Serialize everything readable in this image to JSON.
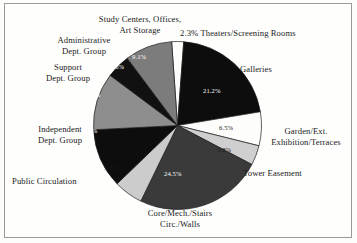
{
  "figure": {
    "background_color": "#fefefd",
    "border_color": "#9a9a9a",
    "text_color": "#1a1a1a"
  },
  "chart_data": {
    "type": "pie",
    "title": "",
    "subtitle": "",
    "xlabel": "",
    "ylabel": "",
    "legend_position": "none",
    "grid": false,
    "units": "percent",
    "start_angle_deg": 356,
    "direction": "clockwise",
    "categories": [
      "Theaters/Screening Rooms",
      "Galleries",
      "Garden/Ext. Exhibition/Terraces",
      "Tower Easement",
      "Core/Mech./Stairs Circ./Walls",
      "Public Circulation",
      "Independent Dept. Group",
      "Support Dept. Group",
      "Administrative Dept. Group",
      "Study Centers, Offices, Art Storage"
    ],
    "values": [
      2.3,
      21.2,
      6.5,
      3.8,
      24.5,
      5.6,
      11.4,
      11.0,
      4.6,
      9.1
    ],
    "value_labels": [
      "2.3%",
      "21.2%",
      "6.5%",
      "3.8%",
      "24.5%",
      "5.6%",
      "11.4%",
      "11.0%",
      "4.6%",
      "9.1%"
    ],
    "colors": [
      "#fdfdfb",
      "#0d0d0d",
      "#fdfdfb",
      "#cfcfcf",
      "#3a3a3a",
      "#cccccc",
      "#0d0d0d",
      "#8e8e8e",
      "#111111",
      "#7c7c7c"
    ],
    "total": 100.0
  },
  "slices": {
    "theaters": {
      "label": "2.3% Theaters/Screening Rooms",
      "pct": "2.3%",
      "name": "Theaters/Screening Rooms"
    },
    "galleries": {
      "label": "Galleries",
      "pct": "21.2%",
      "name": "Galleries"
    },
    "garden": {
      "label_line1": "Garden/Ext.",
      "label_line2": "Exhibition/Terraces",
      "pct": "6.5%",
      "name": "Garden/Ext. Exhibition/Terraces"
    },
    "tower": {
      "label": "Tower Easement",
      "pct": "3.8%",
      "name": "Tower Easement"
    },
    "core": {
      "label_line1": "Core/Mech./Stairs",
      "label_line2": "Circ./Walls",
      "pct": "24.5%",
      "name": "Core/Mech./Stairs Circ./Walls"
    },
    "public": {
      "label": "Public Circulation",
      "pct": "5.6%",
      "name": "Public Circulation"
    },
    "independent": {
      "label_line1": "Independent",
      "label_line2": "Dept. Group",
      "pct": "11.4%",
      "name": "Independent Dept. Group"
    },
    "support": {
      "label_line1": "Support",
      "label_line2": "Dept. Group",
      "pct": "11.0%",
      "name": "Support Dept. Group"
    },
    "administrative": {
      "label_line1": "Administrative",
      "label_line2": "Dept. Group",
      "pct": "4.6%",
      "name": "Administrative Dept. Group"
    },
    "study": {
      "label_line1": "Study Centers, Offices,",
      "label_line2": "Art Storage",
      "pct": "9.1%",
      "name": "Study Centers, Offices, Art Storage"
    }
  }
}
